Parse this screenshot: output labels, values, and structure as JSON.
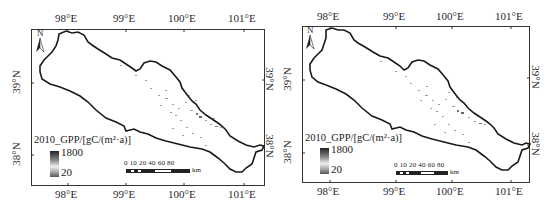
{
  "figure": {
    "panels": [
      {
        "id": "left",
        "top_lon_labels": [
          "98°E",
          "99°E",
          "100°E",
          "101°E"
        ],
        "bottom_lon_labels": [
          "98°E",
          "99°E",
          "100°E",
          "101°E"
        ],
        "left_lat_labels": [
          "39°N",
          "38°N"
        ],
        "right_lat_labels": [
          "39°N",
          "38°N"
        ],
        "north_arrow": "N",
        "legend": {
          "title": "2010_GPP/[gC/(m²·a)]",
          "max": "1800",
          "min": "20"
        },
        "scale_bar": {
          "labels": "0 10 20    40   60   80",
          "unit": "km"
        }
      },
      {
        "id": "right",
        "top_lon_labels": [
          "98°E",
          "99°E",
          "100°E",
          "101°E"
        ],
        "bottom_lon_labels": [
          "98°E",
          "99°E",
          "100°E",
          "101°E"
        ],
        "left_lat_labels": [
          "39°N",
          "38°N"
        ],
        "right_lat_labels": [
          "39°N",
          "38°N"
        ],
        "north_arrow": "N",
        "legend": {
          "title": "2010_GPP/[gC/(m²·a)]",
          "max": "1800",
          "min": "20"
        },
        "scale_bar": {
          "labels": "0 10 20    40   60   80",
          "unit": "km"
        }
      }
    ]
  }
}
